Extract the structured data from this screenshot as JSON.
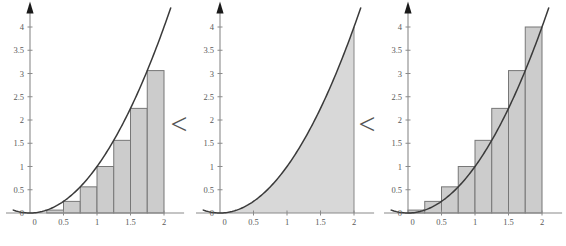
{
  "figure": {
    "relation_symbol_1": "<",
    "relation_symbol_2": "<",
    "accent_color": "#3a3a3a",
    "bar_fill_color": "#cccccc",
    "bar_stroke_color": "#777777",
    "area_fill_color": "#d8d8d8",
    "axis_color": "#8a8a8a",
    "tick_label_color": "#5a5a5a"
  },
  "axes": {
    "x_ticks": [
      "0",
      "0.5",
      "1",
      "1.5",
      "2"
    ],
    "x_tick_values": [
      0,
      0.5,
      1,
      1.5,
      2
    ],
    "y_ticks": [
      "0",
      "0.5",
      "1",
      "1.5",
      "2",
      "2.5",
      "3",
      "3.5",
      "4"
    ],
    "y_tick_values": [
      0,
      0.5,
      1,
      1.5,
      2,
      2.5,
      3,
      3.5,
      4
    ],
    "xlim": [
      -0.25,
      2.3
    ],
    "ylim": [
      -0.25,
      4.25
    ],
    "origin_label": "0"
  },
  "chart_data": [
    {
      "type": "bar",
      "name": "lower-sum",
      "title": "",
      "xlabel": "",
      "ylabel": "",
      "xlim": [
        -0.25,
        2.3
      ],
      "ylim": [
        -0.25,
        4.25
      ],
      "grid": false,
      "legend": "none",
      "function": "y = x^2",
      "interval": [
        0,
        2
      ],
      "n_subintervals": 8,
      "sample_point": "left-endpoint",
      "bar_width": 0.25,
      "bar_left_edges": [
        0,
        0.25,
        0.5,
        0.75,
        1,
        1.25,
        1.5,
        1.75
      ],
      "values": [
        0,
        0.0625,
        0.25,
        0.5625,
        1,
        1.5625,
        2.25,
        3.0625
      ],
      "sum": 1.71875,
      "curve_points_x": [
        -0.25,
        0,
        0.25,
        0.5,
        0.75,
        1,
        1.25,
        1.5,
        1.75,
        2,
        2.1
      ],
      "curve_points_y": [
        0.0625,
        0,
        0.0625,
        0.25,
        0.5625,
        1,
        1.5625,
        2.25,
        3.0625,
        4,
        4.41
      ]
    },
    {
      "type": "area",
      "name": "exact-area",
      "title": "",
      "xlabel": "",
      "ylabel": "",
      "xlim": [
        -0.25,
        2.3
      ],
      "ylim": [
        -0.25,
        4.25
      ],
      "grid": false,
      "legend": "none",
      "function": "y = x^2",
      "interval": [
        0,
        2
      ],
      "values": [
        2.6666666667
      ],
      "exact_area": 2.6666666667,
      "curve_points_x": [
        -0.25,
        0,
        0.25,
        0.5,
        0.75,
        1,
        1.25,
        1.5,
        1.75,
        2,
        2.1
      ],
      "curve_points_y": [
        0.0625,
        0,
        0.0625,
        0.25,
        0.5625,
        1,
        1.5625,
        2.25,
        3.0625,
        4,
        4.41
      ]
    },
    {
      "type": "bar",
      "name": "upper-sum",
      "title": "",
      "xlabel": "",
      "ylabel": "",
      "xlim": [
        -0.25,
        2.3
      ],
      "ylim": [
        -0.25,
        4.25
      ],
      "grid": false,
      "legend": "none",
      "function": "y = x^2",
      "interval": [
        0,
        2
      ],
      "n_subintervals": 8,
      "sample_point": "right-endpoint",
      "bar_width": 0.25,
      "bar_left_edges": [
        0,
        0.25,
        0.5,
        0.75,
        1,
        1.25,
        1.5,
        1.75
      ],
      "values": [
        0.0625,
        0.25,
        0.5625,
        1,
        1.5625,
        2.25,
        3.0625,
        4
      ],
      "sum": 3.71875,
      "curve_points_x": [
        -0.25,
        0,
        0.25,
        0.5,
        0.75,
        1,
        1.25,
        1.5,
        1.75,
        2,
        2.1
      ],
      "curve_points_y": [
        0.0625,
        0,
        0.0625,
        0.25,
        0.5625,
        1,
        1.5625,
        2.25,
        3.0625,
        4,
        4.41
      ]
    }
  ]
}
